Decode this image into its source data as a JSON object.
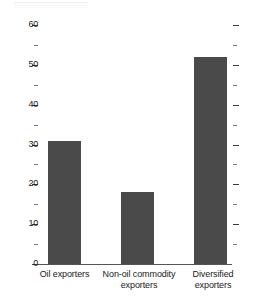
{
  "chart_data": {
    "type": "bar",
    "title": "",
    "subtitle": "",
    "xlabel": "",
    "ylabel": "",
    "categories": [
      "Oil exporters",
      "Non-oil commodity exporters",
      "Diversified exporters"
    ],
    "category_lines": [
      [
        "Oil exporters"
      ],
      [
        "Non-oil commodity",
        "exporters"
      ],
      [
        "Diversified",
        "exporters"
      ]
    ],
    "values": [
      31,
      18,
      52
    ],
    "ylim": [
      0,
      62
    ],
    "y_major_ticks": [
      0,
      10,
      20,
      30,
      40,
      50,
      60
    ],
    "y_major_tick_labels": [
      "0",
      "10",
      "20",
      "30",
      "40",
      "50",
      "60"
    ],
    "y_minor_ticks": [
      5,
      15,
      25,
      35,
      45,
      55
    ],
    "grid": false,
    "legend": null,
    "legend_position": "none",
    "ticks_mirrored_right": true,
    "annotations": []
  },
  "style": {
    "bar_color": "#4a4a4a",
    "axis_color": "#555555",
    "tick_color": "#3a3a3a",
    "minor_tick_color": "#7a7a7a",
    "text_color": "#1a1a1a",
    "background": "#ffffff"
  }
}
